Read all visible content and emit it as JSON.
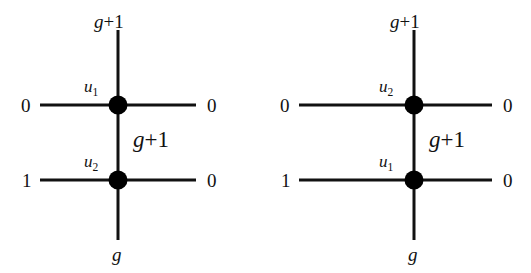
{
  "figure": {
    "type": "two-vertex-graph-diagrams",
    "background_color": "#ffffff",
    "stroke_color": "#111111",
    "node_color": "#000000",
    "panel_count": 2
  },
  "diagrams": [
    {
      "id": "left",
      "name": "left-configuration",
      "nodes": [
        {
          "id": "top",
          "label_prefix": "u",
          "label_sub": "1",
          "label_plain": "u1"
        },
        {
          "id": "bottom",
          "label_prefix": "u",
          "label_sub": "2",
          "label_plain": "u2"
        }
      ],
      "edge_labels": {
        "top_stem": {
          "text": "g+1",
          "base": "g",
          "op": "+",
          "num": "1"
        },
        "middle_stem": {
          "text": "g+1",
          "base": "g",
          "op": "+",
          "num": "1"
        },
        "bottom_stem": {
          "text": "g",
          "base": "g",
          "op": "",
          "num": ""
        },
        "top_left": {
          "text": "0"
        },
        "top_right": {
          "text": "0"
        },
        "bottom_left": {
          "text": "1"
        },
        "bottom_right": {
          "text": "0"
        }
      }
    },
    {
      "id": "right",
      "name": "right-configuration",
      "nodes": [
        {
          "id": "top",
          "label_prefix": "u",
          "label_sub": "2",
          "label_plain": "u2"
        },
        {
          "id": "bottom",
          "label_prefix": "u",
          "label_sub": "1",
          "label_plain": "u1"
        }
      ],
      "edge_labels": {
        "top_stem": {
          "text": "g+1",
          "base": "g",
          "op": "+",
          "num": "1"
        },
        "middle_stem": {
          "text": "g+1",
          "base": "g",
          "op": "+",
          "num": "1"
        },
        "bottom_stem": {
          "text": "g",
          "base": "g",
          "op": "",
          "num": ""
        },
        "top_left": {
          "text": "0"
        },
        "top_right": {
          "text": "0"
        },
        "bottom_left": {
          "text": "1"
        },
        "bottom_right": {
          "text": "0"
        }
      }
    }
  ]
}
